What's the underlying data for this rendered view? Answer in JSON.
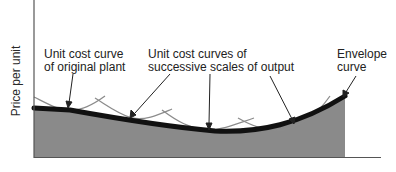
{
  "diagram": {
    "y_axis_label": "Price per unit",
    "x_axis_label": "",
    "labels": {
      "original_plant_line1": "Unit cost curve",
      "original_plant_line2": "of original plant",
      "successive_line1": "Unit cost curves of",
      "successive_line2": "successive scales of output",
      "envelope_line1": "Envelope",
      "envelope_line2": "curve"
    },
    "colors": {
      "shaded_area": "#8a8a8a",
      "envelope_curve": "#111111",
      "unit_cost_curves": "#8c8c8c",
      "axes": "#444444",
      "text": "#222222"
    }
  }
}
